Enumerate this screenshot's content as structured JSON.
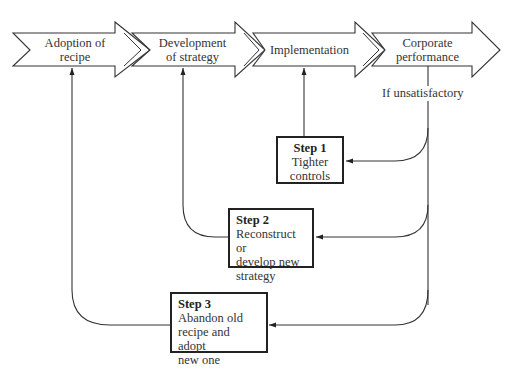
{
  "stages": [
    {
      "line1": "Adoption of",
      "line2": "recipe"
    },
    {
      "line1": "Development",
      "line2": "of strategy"
    },
    {
      "line1": "Implementation",
      "line2": ""
    },
    {
      "line1": "Corporate",
      "line2": "performance"
    }
  ],
  "condition": "If unsatisfactory",
  "steps": [
    {
      "title": "Step 1",
      "lines": [
        "Tighter",
        "controls"
      ]
    },
    {
      "title": "Step 2",
      "lines": [
        "Reconstruct or",
        "develop new",
        "strategy"
      ]
    },
    {
      "title": "Step 3",
      "lines": [
        "Abandon old",
        "recipe and adopt",
        "new one"
      ]
    }
  ],
  "colors": {
    "stroke": "#222222",
    "text": "#333333",
    "background": "#ffffff"
  }
}
